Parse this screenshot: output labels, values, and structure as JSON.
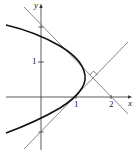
{
  "figure": {
    "type": "parabola-with-perpendicular-tangents",
    "axes": {
      "x_label": "x",
      "y_label": "y",
      "x_ticks": [
        {
          "value": 1,
          "label": "1"
        },
        {
          "value": 2,
          "label": "2"
        }
      ],
      "y_ticks": [
        {
          "value": 1,
          "label": "1"
        }
      ],
      "marked_points_on_y_axis": [
        2,
        -1
      ]
    },
    "curve": {
      "description": "parabola x = 1 + y - y^2",
      "vertex": [
        1.25,
        0.5
      ]
    },
    "tangent_lines": [
      {
        "name": "upper",
        "equation": "x + y = 2",
        "through": [
          [
            0,
            2
          ],
          [
            2,
            0
          ]
        ],
        "touch_point": [
          1,
          1
        ]
      },
      {
        "name": "lower",
        "equation": "y = x - 1",
        "through": [
          [
            0,
            -1
          ],
          [
            1,
            0
          ]
        ],
        "touch_point": [
          1,
          0
        ]
      }
    ],
    "intersection": [
      1.5,
      0.5
    ],
    "right_angle_marker": true,
    "colors": {
      "curve": "#111111",
      "lines": "#444444",
      "axes": "#333333"
    }
  }
}
